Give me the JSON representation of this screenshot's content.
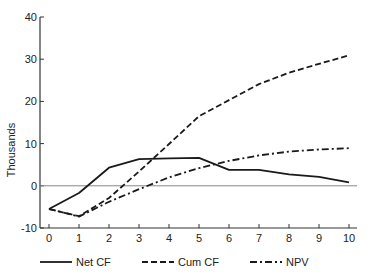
{
  "chart_data": {
    "type": "line",
    "title": "",
    "xlabel": "",
    "ylabel": "Thousands",
    "x": [
      0,
      1,
      2,
      3,
      4,
      5,
      6,
      7,
      8,
      9,
      10
    ],
    "xticks": [
      "0",
      "1",
      "2",
      "3",
      "4",
      "5",
      "6",
      "7",
      "8",
      "9",
      "10"
    ],
    "yticks": [
      "-10",
      "0",
      "10",
      "20",
      "30",
      "40"
    ],
    "ytick_values": [
      -10,
      0,
      10,
      20,
      30,
      40
    ],
    "ylim": [
      -10,
      40
    ],
    "xlim": [
      0,
      10
    ],
    "grid": false,
    "zero_line": true,
    "legend_position": "bottom",
    "series": [
      {
        "name": "Net CF",
        "style": "solid",
        "values": [
          -5.5,
          -1.7,
          4.3,
          6.3,
          6.5,
          6.6,
          3.8,
          3.8,
          2.7,
          2.1,
          0.8
        ]
      },
      {
        "name": "Cum CF",
        "style": "dashed",
        "values": [
          -5.5,
          -7.2,
          -2.9,
          3.4,
          9.9,
          16.5,
          20.3,
          24.1,
          26.8,
          28.9,
          30.9
        ]
      },
      {
        "name": "NPV",
        "style": "dashdot",
        "values": [
          -5.5,
          -7.3,
          -3.8,
          -0.8,
          2.0,
          4.2,
          5.9,
          7.2,
          8.1,
          8.6,
          8.9
        ]
      }
    ]
  },
  "legend": {
    "items": [
      {
        "label": "Net CF",
        "style": "solid"
      },
      {
        "label": "Cum CF",
        "style": "dashed"
      },
      {
        "label": "NPV",
        "style": "dashdot"
      }
    ]
  },
  "colors": {
    "line": "#1a1a1a",
    "axis": "#333333",
    "zero_line": "#888888"
  }
}
